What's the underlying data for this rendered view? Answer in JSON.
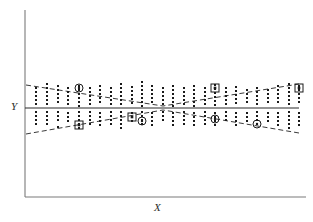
{
  "figure": {
    "type": "residual-scatter-plot",
    "background_color": "#ffffff",
    "width": 313,
    "height": 222
  },
  "axes": {
    "x_label": "X",
    "y_label": "Y",
    "axis_color": "#7a7a7a",
    "x_axis": {
      "x1": 25,
      "y1": 197,
      "x2": 306,
      "y2": 197
    },
    "y_axis": {
      "x1": 25,
      "y1": 10,
      "x2": 25,
      "y2": 197
    },
    "zero_line": {
      "x1": 25,
      "y1": 108,
      "x2": 299,
      "y2": 108,
      "color": "#2b2b2b"
    },
    "ticks": [],
    "tick_labels": []
  },
  "envelope": {
    "color": "#3a3a3a",
    "dash_pattern": "5,3",
    "upper": [
      {
        "x": 26,
        "y": 85
      },
      {
        "x": 163,
        "y": 106
      },
      {
        "x": 299,
        "y": 84
      }
    ],
    "lower": [
      {
        "x": 26,
        "y": 134
      },
      {
        "x": 163,
        "y": 110
      },
      {
        "x": 299,
        "y": 133
      }
    ]
  },
  "chart_data": {
    "type": "scatter",
    "title": "",
    "xlabel": "X",
    "ylabel": "Y",
    "xlim": [
      25,
      306
    ],
    "ylim": [
      60,
      160
    ],
    "grid": false,
    "legend": null,
    "zero_reference_y": 108,
    "columns": [
      {
        "x": 36,
        "points": [
          88,
          92,
          96,
          100,
          104,
          112,
          116,
          120,
          124
        ]
      },
      {
        "x": 47,
        "points": [
          84,
          88,
          92,
          96,
          100,
          104,
          112,
          116,
          120,
          124
        ]
      },
      {
        "x": 58,
        "points": [
          86,
          90,
          94,
          98,
          102,
          112,
          116,
          120,
          127
        ]
      },
      {
        "x": 68,
        "points": [
          88,
          92,
          96,
          100,
          104,
          113,
          117,
          121
        ]
      },
      {
        "x": 79,
        "points": [
          86,
          90,
          94,
          98,
          102,
          106,
          112,
          116,
          120,
          124,
          128
        ]
      },
      {
        "x": 90,
        "points": [
          88,
          92,
          96,
          100,
          104,
          112,
          116,
          120,
          124
        ]
      },
      {
        "x": 100,
        "points": [
          86,
          90,
          94,
          98,
          102,
          113,
          117,
          121,
          125
        ]
      },
      {
        "x": 111,
        "points": [
          88,
          92,
          96,
          100,
          104,
          112,
          116,
          120,
          124
        ]
      },
      {
        "x": 121,
        "points": [
          84,
          88,
          92,
          96,
          100,
          104,
          112,
          116,
          120,
          124,
          128
        ]
      },
      {
        "x": 132,
        "points": [
          87,
          91,
          95,
          99,
          103,
          113,
          117,
          121
        ]
      },
      {
        "x": 142,
        "points": [
          82,
          86,
          90,
          94,
          98,
          102,
          106,
          112,
          116,
          120,
          124
        ]
      },
      {
        "x": 152,
        "points": [
          86,
          90,
          94,
          98,
          102,
          113,
          117,
          121,
          125
        ]
      },
      {
        "x": 163,
        "points": [
          88,
          92,
          96,
          100,
          104,
          112,
          116,
          120
        ]
      },
      {
        "x": 173,
        "points": [
          86,
          90,
          94,
          98,
          102,
          106,
          113,
          117,
          121,
          125
        ]
      },
      {
        "x": 184,
        "points": [
          88,
          92,
          96,
          100,
          104,
          112,
          116,
          120,
          124
        ]
      },
      {
        "x": 194,
        "points": [
          86,
          90,
          94,
          98,
          102,
          106,
          113,
          117,
          121,
          125
        ]
      },
      {
        "x": 205,
        "points": [
          88,
          92,
          96,
          100,
          104,
          112,
          116,
          120,
          124
        ]
      },
      {
        "x": 215,
        "points": [
          85,
          89,
          93,
          97,
          101,
          105,
          113,
          117,
          121,
          125
        ]
      },
      {
        "x": 226,
        "points": [
          88,
          92,
          96,
          100,
          104,
          112,
          116,
          120
        ]
      },
      {
        "x": 236,
        "points": [
          87,
          91,
          95,
          99,
          103,
          113,
          117,
          121,
          125
        ]
      },
      {
        "x": 247,
        "points": [
          90,
          94,
          98,
          102,
          113,
          117,
          121
        ]
      },
      {
        "x": 257,
        "points": [
          88,
          92,
          96,
          100,
          104,
          112,
          116,
          120,
          124
        ]
      },
      {
        "x": 268,
        "points": [
          90,
          94,
          98,
          102,
          113,
          117,
          121
        ]
      },
      {
        "x": 278,
        "points": [
          86,
          90,
          94,
          98,
          102,
          113,
          117,
          121,
          125
        ]
      },
      {
        "x": 289,
        "points": [
          84,
          88,
          92,
          96,
          100,
          104,
          112,
          116,
          120,
          124,
          128
        ]
      },
      {
        "x": 299,
        "points": [
          86,
          90,
          94,
          98,
          102,
          113,
          117,
          121,
          125
        ]
      }
    ],
    "highlighted_points": [
      {
        "x": 79,
        "y": 88,
        "marker": "circle-dot"
      },
      {
        "x": 79,
        "y": 125,
        "marker": "square-dot"
      },
      {
        "x": 132,
        "y": 117,
        "marker": "square-dot"
      },
      {
        "x": 142,
        "y": 121,
        "marker": "circle-dot"
      },
      {
        "x": 215,
        "y": 88,
        "marker": "square-dot"
      },
      {
        "x": 215,
        "y": 119,
        "marker": "circle-dot"
      },
      {
        "x": 257,
        "y": 124,
        "marker": "circle-dot"
      },
      {
        "x": 299,
        "y": 88,
        "marker": "square-dot"
      }
    ],
    "marker_styles": {
      "dot": {
        "color": "#1a1a1a",
        "size": 2
      },
      "circle-dot": {
        "stroke": "#1a1a1a",
        "radius": 4
      },
      "square-dot": {
        "stroke": "#1a1a1a",
        "side": 8
      }
    }
  }
}
